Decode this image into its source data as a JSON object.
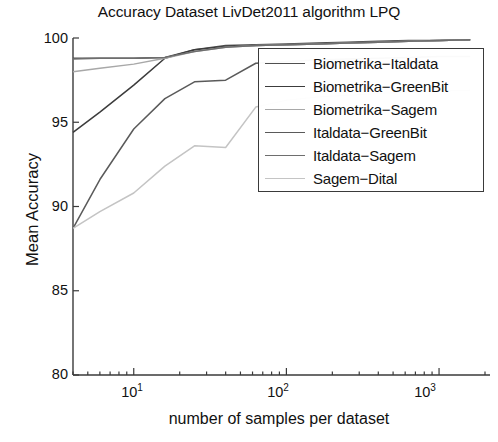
{
  "chart_data": {
    "type": "line",
    "title": "Accuracy Dataset LivDet2011 algorithm LPQ",
    "xlabel": "number of samples per dataset",
    "ylabel": "Mean Accuracy",
    "xscale": "log",
    "xlim": [
      4,
      2000
    ],
    "ylim": [
      80,
      100
    ],
    "yticks": [
      "80",
      "85",
      "90",
      "95",
      "100"
    ],
    "ytick_values": [
      80,
      85,
      90,
      95,
      100
    ],
    "xticks": [
      "10",
      "10",
      "10"
    ],
    "xtick_exponents": [
      "1",
      "2",
      "3"
    ],
    "xtick_values": [
      10,
      100,
      1000
    ],
    "grid": false,
    "legend_position": "upper right",
    "x": [
      4,
      6,
      10,
      16,
      25,
      40,
      63,
      100,
      160,
      250,
      400,
      630,
      1000,
      1600
    ],
    "series": [
      {
        "name": "Biometrika-Italdata",
        "color": "#4f4f4f",
        "values": [
          98.8,
          98.8,
          98.8,
          98.85,
          99.3,
          99.55,
          99.6,
          99.65,
          99.7,
          99.75,
          99.8,
          99.85,
          99.85,
          99.9
        ]
      },
      {
        "name": "Biometrika-GreenBit",
        "color": "#3c3c3c",
        "values": [
          94.4,
          95.6,
          97.2,
          98.8,
          99.3,
          99.5,
          99.55,
          99.6,
          99.65,
          99.7,
          99.75,
          99.8,
          99.85,
          99.9
        ]
      },
      {
        "name": "Biometrika-Sagem",
        "color": "#a8a8a8",
        "values": [
          98.0,
          98.2,
          98.45,
          98.8,
          99.2,
          99.45,
          99.55,
          99.6,
          99.65,
          99.7,
          99.75,
          99.8,
          99.85,
          99.9
        ]
      },
      {
        "name": "Italdata-GreenBit",
        "color": "#5a5a5a",
        "values": [
          88.7,
          91.6,
          94.6,
          96.4,
          97.4,
          97.5,
          98.5,
          98.6,
          98.7,
          98.75,
          98.8,
          98.85,
          98.9,
          98.9
        ]
      },
      {
        "name": "Italdata-Sagem",
        "color": "#6e6e6e",
        "values": [
          98.75,
          98.8,
          98.8,
          98.85,
          99.2,
          99.45,
          99.55,
          99.6,
          99.65,
          99.7,
          99.75,
          99.8,
          99.85,
          99.9
        ]
      },
      {
        "name": "Sagem-Dital",
        "color": "#c4c4c4",
        "values": [
          88.7,
          89.7,
          90.8,
          92.4,
          93.6,
          93.5,
          95.9,
          96.3,
          96.5,
          96.6,
          96.7,
          96.8,
          96.85,
          96.9
        ]
      }
    ]
  },
  "legend": {
    "items": [
      {
        "label": "Biometrika−Italdata",
        "color": "#4f4f4f"
      },
      {
        "label": "Biometrika−GreenBit",
        "color": "#3c3c3c"
      },
      {
        "label": "Biometrika−Sagem",
        "color": "#a8a8a8"
      },
      {
        "label": "Italdata−GreenBit",
        "color": "#5a5a5a"
      },
      {
        "label": "Italdata−Sagem",
        "color": "#6e6e6e"
      },
      {
        "label": "Sagem−Dital",
        "color": "#c4c4c4"
      }
    ]
  },
  "axes": {
    "title": "Accuracy Dataset LivDet2011 algorithm LPQ",
    "ylabel": "Mean Accuracy",
    "xlabel": "number of samples per dataset",
    "ytick_labels": [
      "100",
      "95",
      "90",
      "85",
      "80"
    ],
    "xtick_bases": [
      "10",
      "10",
      "10"
    ],
    "xtick_exps": [
      "1",
      "2",
      "3"
    ]
  }
}
